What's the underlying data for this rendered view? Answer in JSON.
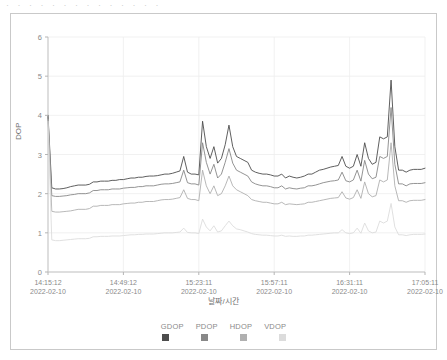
{
  "top_strip": {
    "clipped_text": "· · · · · · · · · · · · · ·"
  },
  "chart_data": {
    "type": "line",
    "title": "",
    "xlabel": "날짜/시간",
    "ylabel": "DOP",
    "ylim": [
      0,
      6
    ],
    "yticks": [
      0,
      1,
      2,
      3,
      4,
      5,
      6
    ],
    "grid": true,
    "legend_position": "bottom",
    "xtick_labels": [
      {
        "time": "14:15:12",
        "date": "2022-02-10"
      },
      {
        "time": "14:49:12",
        "date": "2022-02-10"
      },
      {
        "time": "15:23:11",
        "date": "2022-02-10"
      },
      {
        "time": "15:57:11",
        "date": "2022-02-10"
      },
      {
        "time": "16:31:11",
        "date": "2022-02-10"
      },
      {
        "time": "17:05:11",
        "date": "2022-02-10"
      }
    ],
    "x": [
      0,
      1,
      2,
      3,
      4,
      5,
      6,
      7,
      8,
      9,
      10,
      11,
      12,
      13,
      14,
      15,
      16,
      17,
      18,
      19,
      20,
      21,
      22,
      23,
      24,
      25,
      26,
      27,
      28,
      29,
      30,
      31,
      32,
      33,
      34,
      35,
      36,
      37,
      38,
      39,
      40,
      41,
      42,
      43,
      44,
      45,
      46,
      47,
      48,
      49,
      50,
      51,
      52,
      53,
      54,
      55,
      56,
      57,
      58,
      59,
      60,
      61,
      62,
      63,
      64,
      65,
      66,
      67,
      68,
      69,
      70,
      71,
      72,
      73,
      74,
      75,
      76,
      77,
      78,
      79,
      80,
      81,
      82,
      83,
      84,
      85,
      86,
      87,
      88,
      89,
      90,
      91,
      92,
      93,
      94,
      95,
      96,
      97,
      98,
      99,
      100
    ],
    "series": [
      {
        "name": "GDOP",
        "color": "#4d4d4d",
        "values": [
          4.0,
          2.15,
          2.12,
          2.12,
          2.13,
          2.15,
          2.18,
          2.2,
          2.22,
          2.22,
          2.22,
          2.24,
          2.3,
          2.3,
          2.32,
          2.32,
          2.32,
          2.34,
          2.34,
          2.36,
          2.36,
          2.38,
          2.4,
          2.4,
          2.42,
          2.42,
          2.44,
          2.45,
          2.45,
          2.46,
          2.48,
          2.5,
          2.5,
          2.52,
          2.55,
          2.58,
          2.95,
          2.55,
          2.5,
          2.5,
          2.48,
          3.85,
          3.2,
          2.9,
          3.2,
          2.78,
          2.9,
          3.25,
          3.75,
          3.2,
          2.95,
          2.9,
          2.85,
          2.8,
          2.6,
          2.55,
          2.52,
          2.5,
          2.5,
          2.48,
          2.45,
          2.45,
          2.5,
          2.4,
          2.45,
          2.42,
          2.4,
          2.42,
          2.45,
          2.5,
          2.5,
          2.55,
          2.6,
          2.62,
          2.65,
          2.68,
          2.7,
          2.72,
          2.95,
          2.7,
          2.65,
          2.7,
          3.0,
          2.7,
          3.3,
          2.9,
          2.75,
          2.8,
          3.45,
          3.4,
          3.45,
          4.9,
          3.2,
          2.6,
          2.6,
          2.55,
          2.6,
          2.62,
          2.62,
          2.62,
          2.65
        ]
      },
      {
        "name": "PDOP",
        "color": "#888888",
        "values": [
          3.95,
          1.95,
          1.93,
          1.93,
          1.94,
          1.95,
          1.97,
          1.98,
          2.0,
          2.0,
          2.0,
          2.02,
          2.08,
          2.08,
          2.1,
          2.1,
          2.1,
          2.12,
          2.12,
          2.12,
          2.14,
          2.15,
          2.16,
          2.16,
          2.18,
          2.18,
          2.2,
          2.2,
          2.2,
          2.22,
          2.24,
          2.25,
          2.25,
          2.26,
          2.28,
          2.3,
          2.6,
          2.28,
          2.25,
          2.25,
          2.22,
          3.3,
          2.8,
          2.5,
          2.75,
          2.4,
          2.5,
          2.8,
          3.15,
          2.78,
          2.6,
          2.55,
          2.5,
          2.45,
          2.3,
          2.25,
          2.22,
          2.2,
          2.2,
          2.18,
          2.15,
          2.15,
          2.2,
          2.12,
          2.15,
          2.13,
          2.12,
          2.14,
          2.15,
          2.2,
          2.2,
          2.22,
          2.25,
          2.28,
          2.3,
          2.32,
          2.33,
          2.35,
          2.55,
          2.33,
          2.3,
          2.35,
          2.6,
          2.32,
          2.85,
          2.5,
          2.38,
          2.42,
          2.95,
          2.9,
          2.95,
          4.2,
          2.75,
          2.25,
          2.25,
          2.2,
          2.25,
          2.26,
          2.26,
          2.26,
          2.28
        ]
      },
      {
        "name": "HDOP",
        "color": "#b0b0b0",
        "values": [
          3.9,
          1.55,
          1.53,
          1.53,
          1.54,
          1.55,
          1.56,
          1.58,
          1.6,
          1.6,
          1.6,
          1.62,
          1.68,
          1.68,
          1.7,
          1.7,
          1.7,
          1.72,
          1.72,
          1.72,
          1.74,
          1.75,
          1.76,
          1.76,
          1.78,
          1.78,
          1.8,
          1.8,
          1.8,
          1.82,
          1.84,
          1.85,
          1.85,
          1.86,
          1.88,
          1.9,
          2.1,
          1.88,
          1.85,
          1.85,
          1.82,
          2.6,
          2.2,
          2.0,
          2.2,
          1.95,
          2.0,
          2.2,
          2.45,
          2.2,
          2.1,
          2.05,
          2.0,
          1.95,
          1.85,
          1.82,
          1.8,
          1.78,
          1.78,
          1.76,
          1.74,
          1.74,
          1.78,
          1.72,
          1.74,
          1.73,
          1.72,
          1.73,
          1.74,
          1.78,
          1.78,
          1.8,
          1.82,
          1.84,
          1.86,
          1.88,
          1.89,
          1.9,
          2.05,
          1.89,
          1.86,
          1.9,
          2.1,
          1.88,
          2.3,
          2.0,
          1.92,
          1.95,
          2.35,
          2.3,
          2.35,
          3.3,
          2.2,
          1.82,
          1.82,
          1.78,
          1.82,
          1.83,
          1.83,
          1.83,
          1.85
        ]
      },
      {
        "name": "VDOP",
        "color": "#dcdcdc",
        "values": [
          3.85,
          0.82,
          0.8,
          0.8,
          0.81,
          0.82,
          0.83,
          0.84,
          0.85,
          0.85,
          0.85,
          0.86,
          0.9,
          0.9,
          0.91,
          0.91,
          0.91,
          0.92,
          0.92,
          0.92,
          0.93,
          0.94,
          0.95,
          0.95,
          0.96,
          0.96,
          0.97,
          0.97,
          0.97,
          0.98,
          0.99,
          1.0,
          1.0,
          1.0,
          1.01,
          1.02,
          1.12,
          1.01,
          1.0,
          1.0,
          0.98,
          1.35,
          1.15,
          1.05,
          1.18,
          1.02,
          1.05,
          1.18,
          1.3,
          1.18,
          1.1,
          1.08,
          1.05,
          1.02,
          0.98,
          0.96,
          0.95,
          0.94,
          0.94,
          0.93,
          0.92,
          0.92,
          0.94,
          0.91,
          0.92,
          0.91,
          0.91,
          0.92,
          0.92,
          0.94,
          0.94,
          0.95,
          0.96,
          0.97,
          0.98,
          0.99,
          1.0,
          1.0,
          1.08,
          1.0,
          0.98,
          1.0,
          1.12,
          0.99,
          1.25,
          1.05,
          1.0,
          1.02,
          1.3,
          1.25,
          1.3,
          1.75,
          1.15,
          0.95,
          0.95,
          0.93,
          0.95,
          0.96,
          0.96,
          0.96,
          0.97
        ]
      }
    ]
  }
}
